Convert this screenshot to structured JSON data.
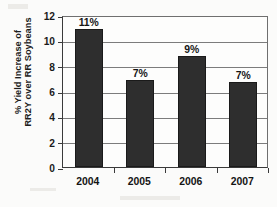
{
  "chart_data": {
    "type": "bar",
    "title": "",
    "xlabel": "",
    "ylabel_lines": [
      "% Yield Increase of",
      "RR2Y over RR Soybeans"
    ],
    "ylabel": "% Yield Increase of RR2Y over RR Soybeans",
    "categories": [
      "2004",
      "2005",
      "2006",
      "2007"
    ],
    "values": [
      10.9,
      6.9,
      8.8,
      6.7
    ],
    "data_labels": [
      "11%",
      "7%",
      "9%",
      "7%"
    ],
    "ylim": [
      0,
      12
    ],
    "ytick_labels": [
      "0",
      "2",
      "4",
      "6",
      "8",
      "10",
      "12"
    ],
    "ytick_values": [
      0,
      2,
      4,
      6,
      8,
      10,
      12
    ],
    "grid": true,
    "legend": false,
    "series": [
      {
        "name": "% Yield Increase of RR2Y over RR Soybeans",
        "values": [
          10.9,
          6.9,
          8.8,
          6.7
        ]
      }
    ],
    "colors": {
      "bar": "#2e2e2e",
      "grid": "#7c7c7c",
      "axis": "#3a3a3a",
      "text": "#141414",
      "background": "#fdfdfc"
    }
  }
}
